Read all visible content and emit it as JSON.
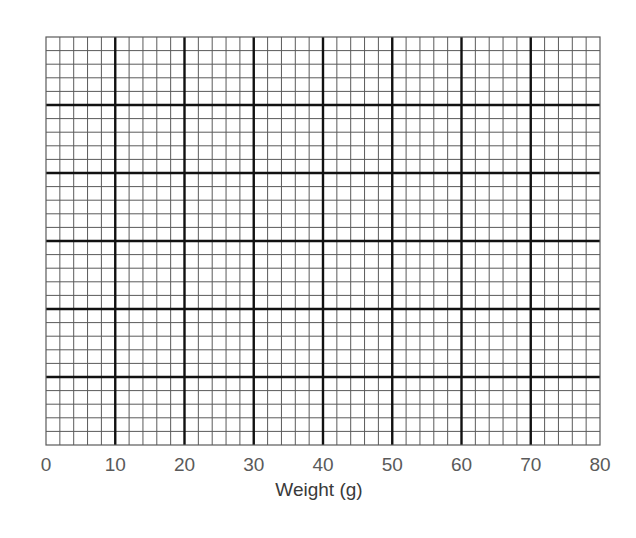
{
  "chart_data": {
    "type": "line",
    "title": "",
    "xlabel": "Weight (g)",
    "ylabel": "",
    "xlim": [
      0,
      80
    ],
    "ylim": null,
    "x_ticks": [
      0,
      10,
      20,
      30,
      40,
      50,
      60,
      70,
      80
    ],
    "x_tick_labels": [
      "0",
      "10",
      "20",
      "30",
      "40",
      "50",
      "60",
      "70",
      "80"
    ],
    "y_ticks": [],
    "series": [],
    "grid": {
      "on": true,
      "major_columns": 8,
      "major_rows": 6,
      "minor_per_major": 5,
      "minor_columns": 40,
      "minor_rows": 30
    },
    "legend": null,
    "note": "Blank graph paper with labeled x-axis only; no data plotted"
  },
  "colors": {
    "major_line": "#111111",
    "minor_line": "#5a5a5a",
    "tick_label": "#5a5a5a",
    "axis_title": "#3a3a3a",
    "background": "#ffffff"
  },
  "layout": {
    "plot_left": 46,
    "plot_top": 37,
    "plot_width": 554,
    "plot_height": 408
  }
}
